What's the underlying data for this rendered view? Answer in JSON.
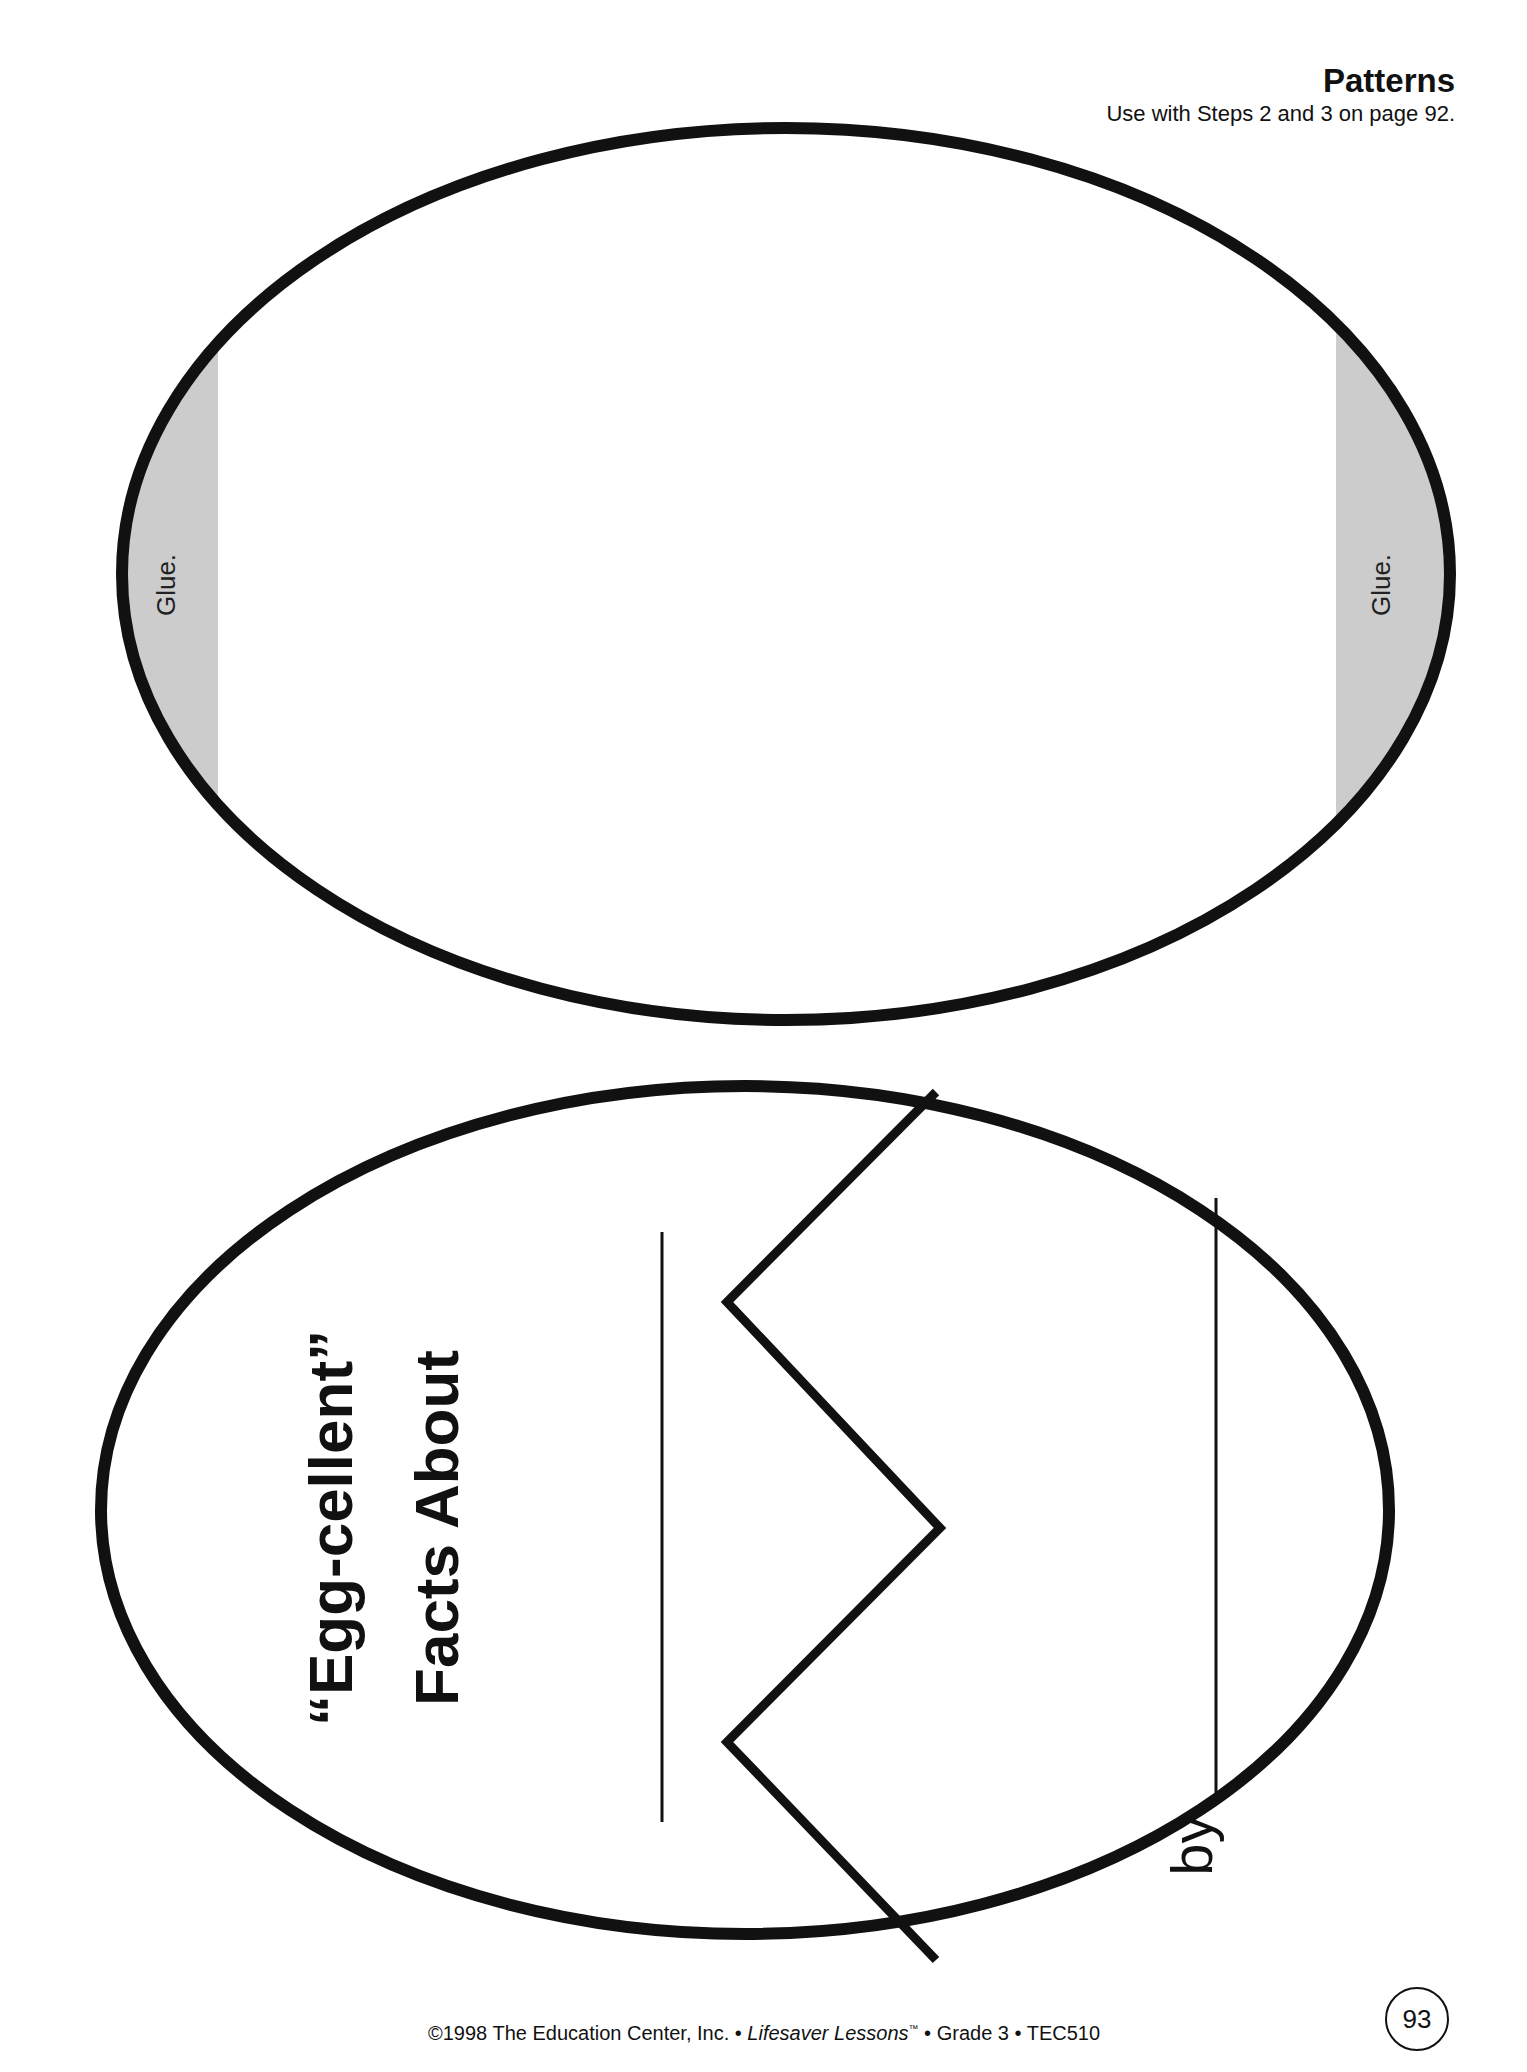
{
  "header": {
    "title": "Patterns",
    "subtitle": "Use with Steps 2 and 3 on page 92."
  },
  "top_egg": {
    "glue_left_label": "Glue.",
    "glue_right_label": "Glue."
  },
  "bottom_egg": {
    "title_line1": "“Egg-cellent”",
    "title_line2": "Facts About",
    "by_label": "by"
  },
  "footer": {
    "copyright": "©1998 The Education Center, Inc. • ",
    "series": "Lifesaver Lessons",
    "trademark": "™",
    "rest": " • Grade 3 • TEC510"
  },
  "page_number": "93",
  "colors": {
    "ink": "#111111",
    "glue_fill": "#cccccc",
    "paper": "#ffffff"
  }
}
